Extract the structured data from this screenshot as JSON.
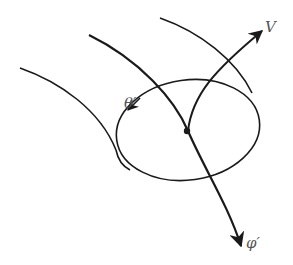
{
  "diagram": {
    "labels": {
      "v": "V",
      "theta": "θ′",
      "phi": "φ′"
    },
    "colors": {
      "stroke": "#1a1a1a",
      "label": "#555555",
      "background": "#ffffff"
    },
    "elements": [
      {
        "id": "left-field-line",
        "type": "curve"
      },
      {
        "id": "center-field-line",
        "type": "curve-arrow",
        "label": "φ′"
      },
      {
        "id": "right-field-line",
        "type": "curve"
      },
      {
        "id": "ellipse-cross-section",
        "type": "ellipse",
        "label": "θ′"
      },
      {
        "id": "v-arrow",
        "type": "curve-arrow",
        "label": "V"
      },
      {
        "id": "origin-point",
        "type": "dot"
      }
    ]
  }
}
